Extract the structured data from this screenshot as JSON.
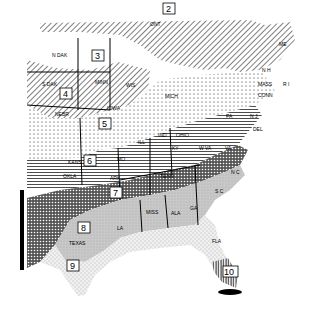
{
  "map": {
    "type": "zone map",
    "region": "Eastern United States",
    "zones": [
      {
        "id": "2",
        "label": "2",
        "x": 170,
        "y": 12,
        "pattern": "diagonal-hatch"
      },
      {
        "id": "3",
        "label": "3",
        "x": 97,
        "y": 57,
        "pattern": "white"
      },
      {
        "id": "4",
        "label": "4",
        "x": 65,
        "y": 95,
        "pattern": "diagonal-hatch"
      },
      {
        "id": "5",
        "label": "5",
        "x": 104,
        "y": 124,
        "pattern": "dots"
      },
      {
        "id": "6",
        "label": "6",
        "x": 89,
        "y": 161,
        "pattern": "horizontal-lines"
      },
      {
        "id": "7",
        "label": "7",
        "x": 115,
        "y": 193,
        "pattern": "crosshatch"
      },
      {
        "id": "8",
        "label": "8",
        "x": 83,
        "y": 228,
        "pattern": "gray-stipple"
      },
      {
        "id": "9",
        "label": "9",
        "x": 72,
        "y": 266,
        "pattern": "light-dots"
      },
      {
        "id": "10",
        "label": "10",
        "x": 228,
        "y": 272,
        "pattern": "vertical-lines"
      }
    ],
    "state_labels": [
      {
        "text": "N DAK",
        "x": 52,
        "y": 57
      },
      {
        "text": "S DAK",
        "x": 42,
        "y": 86
      },
      {
        "text": "NEBR",
        "x": 55,
        "y": 116
      },
      {
        "text": "KANS",
        "x": 68,
        "y": 164
      },
      {
        "text": "OKLA",
        "x": 63,
        "y": 178
      },
      {
        "text": "TEXAS",
        "x": 69,
        "y": 245
      },
      {
        "text": "MINN",
        "x": 95,
        "y": 84
      },
      {
        "text": "IOWA",
        "x": 107,
        "y": 110
      },
      {
        "text": "WIS",
        "x": 126,
        "y": 87
      },
      {
        "text": "MO",
        "x": 117,
        "y": 161
      },
      {
        "text": "ARK",
        "x": 110,
        "y": 180
      },
      {
        "text": "LA",
        "x": 117,
        "y": 230
      },
      {
        "text": "MISS",
        "x": 146,
        "y": 214
      },
      {
        "text": "ALA",
        "x": 171,
        "y": 215
      },
      {
        "text": "GA",
        "x": 190,
        "y": 210
      },
      {
        "text": "FLA",
        "x": 212,
        "y": 243
      },
      {
        "text": "S C",
        "x": 215,
        "y": 193
      },
      {
        "text": "N C",
        "x": 231,
        "y": 174
      },
      {
        "text": "TENN",
        "x": 160,
        "y": 178
      },
      {
        "text": "KY",
        "x": 172,
        "y": 150
      },
      {
        "text": "ILL",
        "x": 138,
        "y": 144
      },
      {
        "text": "IND",
        "x": 158,
        "y": 137
      },
      {
        "text": "OHIO",
        "x": 176,
        "y": 137
      },
      {
        "text": "W VA",
        "x": 199,
        "y": 150
      },
      {
        "text": "VA",
        "x": 225,
        "y": 150
      },
      {
        "text": "PA",
        "x": 226,
        "y": 118
      },
      {
        "text": "MICH",
        "x": 165,
        "y": 98
      },
      {
        "text": "ONT",
        "x": 150,
        "y": 26
      },
      {
        "text": "ME",
        "x": 279,
        "y": 46
      },
      {
        "text": "N H",
        "x": 262,
        "y": 72
      },
      {
        "text": "MASS",
        "x": 258,
        "y": 86
      },
      {
        "text": "CONN",
        "x": 258,
        "y": 97
      },
      {
        "text": "R I",
        "x": 283,
        "y": 86
      },
      {
        "text": "N J",
        "x": 250,
        "y": 118
      },
      {
        "text": "DEL",
        "x": 253,
        "y": 131
      }
    ]
  }
}
